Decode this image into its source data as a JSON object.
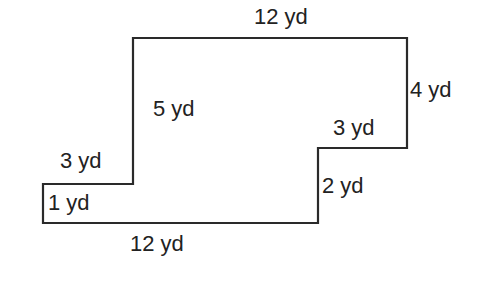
{
  "figure": {
    "type": "rectilinear-polygon",
    "unit": "yd",
    "stroke_color": "#2a2a2a",
    "background": "#ffffff",
    "vertices": [
      [
        133,
        38
      ],
      [
        407,
        38
      ],
      [
        407,
        148
      ],
      [
        318,
        148
      ],
      [
        318,
        223
      ],
      [
        43,
        223
      ],
      [
        43,
        184
      ],
      [
        133,
        184
      ]
    ],
    "labels": {
      "top": "12 yd",
      "right": "4 yd",
      "inner_vertical": "5 yd",
      "right_step": "3 yd",
      "left_step": "3 yd",
      "right_lower": "2 yd",
      "left_short": "1 yd",
      "bottom": "12 yd"
    }
  }
}
